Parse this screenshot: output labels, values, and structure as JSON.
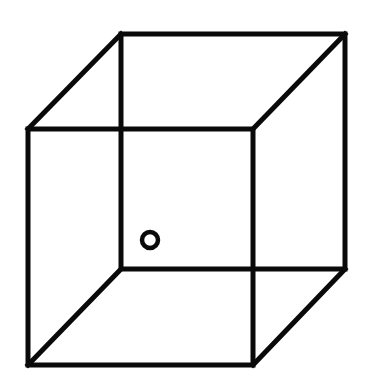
{
  "figure": {
    "stroke_color": "#0a0a0a",
    "background": "#ffffff",
    "stroke_width": 5,
    "front_face": {
      "x1": 28,
      "y1": 129,
      "x2": 253,
      "y2": 365
    },
    "back_face": {
      "x1": 121,
      "y1": 34,
      "x2": 345,
      "y2": 269
    },
    "marker": {
      "shape": "circle",
      "cx": 150,
      "cy": 240,
      "r": 8
    }
  }
}
